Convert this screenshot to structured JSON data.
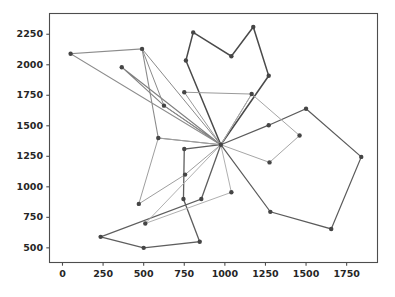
{
  "figure": {
    "title": "",
    "background_color": "#ffffff",
    "width": 395,
    "height": 297
  },
  "axes": {
    "frame_color": "#4d4d4d",
    "tick_color": "#262626",
    "grid": false,
    "legend": null,
    "xlabel": "",
    "ylabel": "",
    "xlim": [
      -80,
      1940
    ],
    "ylim": [
      380,
      2420
    ],
    "xticks": [
      0,
      250,
      500,
      750,
      1000,
      1250,
      1500,
      1750
    ],
    "yticks": [
      500,
      750,
      1000,
      1250,
      1500,
      1750,
      2000,
      2250
    ],
    "xtick_labels": [
      "0",
      "250",
      "500",
      "750",
      "1000",
      "1250",
      "1500",
      "1750"
    ],
    "ytick_labels": [
      "500",
      "750",
      "1000",
      "1250",
      "1500",
      "1750",
      "2000",
      "2250"
    ]
  },
  "chart_data": {
    "type": "line",
    "title": "",
    "xlabel": "",
    "ylabel": "",
    "xlim": [
      -80,
      1940
    ],
    "ylim": [
      380,
      2420
    ],
    "grid": false,
    "legend_position": "none",
    "marker": "circle",
    "marker_size": 2.2,
    "hub_point": [
      975,
      1345
    ],
    "series": [
      {
        "name": "route-1",
        "color": "#4a4a4a",
        "linewidth": 1.5,
        "points": [
          [
            975,
            1345
          ],
          [
            760,
            2035
          ],
          [
            805,
            2265
          ],
          [
            1040,
            2070
          ],
          [
            1175,
            2310
          ],
          [
            1270,
            1910
          ],
          [
            975,
            1345
          ]
        ]
      },
      {
        "name": "route-2",
        "color": "#5b5b5b",
        "linewidth": 1.2,
        "points": [
          [
            975,
            1345
          ],
          [
            1270,
            1505
          ],
          [
            1500,
            1640
          ],
          [
            1840,
            1245
          ],
          [
            1655,
            655
          ],
          [
            1280,
            795
          ],
          [
            975,
            1345
          ]
        ]
      },
      {
        "name": "route-3",
        "color": "#5e5e5e",
        "linewidth": 1.3,
        "points": [
          [
            975,
            1345
          ],
          [
            750,
            1310
          ],
          [
            745,
            900
          ],
          [
            845,
            550
          ],
          [
            500,
            500
          ],
          [
            235,
            590
          ],
          [
            855,
            900
          ],
          [
            975,
            1345
          ]
        ]
      },
      {
        "name": "route-4",
        "color": "#8c8c8c",
        "linewidth": 1.1,
        "points": [
          [
            975,
            1345
          ],
          [
            50,
            2090
          ],
          [
            490,
            2130
          ],
          [
            590,
            1400
          ],
          [
            975,
            1345
          ]
        ]
      },
      {
        "name": "route-5",
        "color": "#7f7f7f",
        "linewidth": 1.1,
        "points": [
          [
            975,
            1345
          ],
          [
            365,
            1980
          ],
          [
            625,
            1665
          ],
          [
            975,
            1345
          ]
        ]
      },
      {
        "name": "route-6",
        "color": "#9a9a9a",
        "linewidth": 1.0,
        "points": [
          [
            975,
            1345
          ],
          [
            750,
            1775
          ],
          [
            1165,
            1760
          ],
          [
            975,
            1345
          ]
        ]
      },
      {
        "name": "route-7",
        "color": "#a6a6a6",
        "linewidth": 1.0,
        "points": [
          [
            975,
            1345
          ],
          [
            1275,
            1200
          ],
          [
            1460,
            1420
          ],
          [
            1165,
            1760
          ],
          [
            975,
            1345
          ]
        ]
      },
      {
        "name": "route-8",
        "color": "#b0b0b0",
        "linewidth": 1.0,
        "points": [
          [
            975,
            1345
          ],
          [
            1040,
            955
          ],
          [
            510,
            700
          ],
          [
            975,
            1345
          ]
        ]
      },
      {
        "name": "route-9",
        "color": "#9e9e9e",
        "linewidth": 1.0,
        "points": [
          [
            975,
            1345
          ],
          [
            755,
            1100
          ],
          [
            470,
            860
          ],
          [
            590,
            1400
          ],
          [
            975,
            1345
          ]
        ]
      },
      {
        "name": "route-10",
        "color": "#8a8a8a",
        "linewidth": 1.0,
        "points": [
          [
            975,
            1345
          ],
          [
            625,
            1665
          ],
          [
            490,
            2130
          ],
          [
            975,
            1345
          ]
        ]
      }
    ],
    "all_nodes": [
      [
        975,
        1345
      ],
      [
        760,
        2035
      ],
      [
        805,
        2265
      ],
      [
        1040,
        2070
      ],
      [
        1175,
        2310
      ],
      [
        1270,
        1910
      ],
      [
        1270,
        1505
      ],
      [
        1500,
        1640
      ],
      [
        1840,
        1245
      ],
      [
        1655,
        655
      ],
      [
        1280,
        795
      ],
      [
        750,
        1310
      ],
      [
        745,
        900
      ],
      [
        845,
        550
      ],
      [
        500,
        500
      ],
      [
        235,
        590
      ],
      [
        855,
        900
      ],
      [
        50,
        2090
      ],
      [
        490,
        2130
      ],
      [
        590,
        1400
      ],
      [
        365,
        1980
      ],
      [
        625,
        1665
      ],
      [
        750,
        1775
      ],
      [
        1165,
        1760
      ],
      [
        1275,
        1200
      ],
      [
        1460,
        1420
      ],
      [
        1040,
        955
      ],
      [
        510,
        700
      ],
      [
        755,
        1100
      ],
      [
        470,
        860
      ]
    ]
  }
}
